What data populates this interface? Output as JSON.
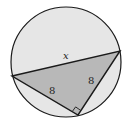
{
  "diagram": {
    "labels": {
      "hypotenuse": "x",
      "left_leg": "8",
      "right_leg": "8"
    },
    "right_angle_marker": true,
    "colors": {
      "circle_fill": "#e6e6e6",
      "triangle_fill": "#b8b8b8",
      "stroke": "#1a1a1a"
    }
  }
}
